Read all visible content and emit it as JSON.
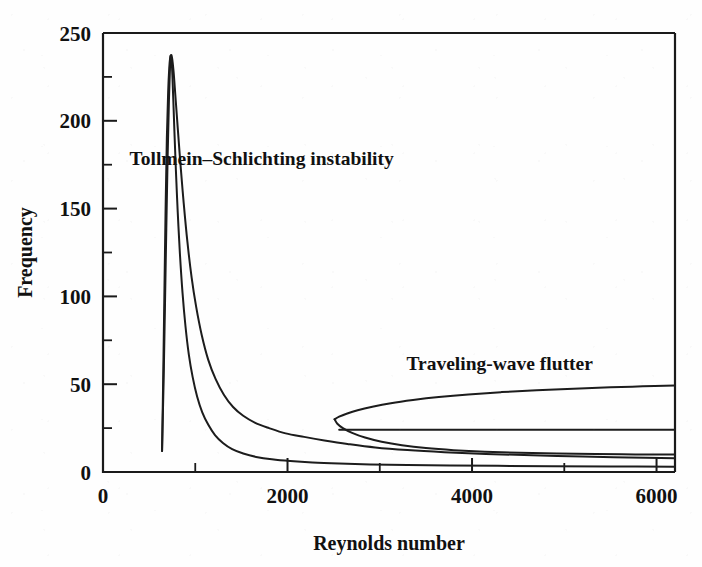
{
  "chart_data": {
    "type": "line",
    "title": "",
    "xlabel": "Reynolds number",
    "ylabel": "Frequency",
    "xlim": [
      0,
      6200
    ],
    "ylim": [
      0,
      250
    ],
    "grid": false,
    "legend": "none",
    "x_ticks_major": [
      0,
      2000,
      4000,
      6000
    ],
    "x_tick_labels": [
      "0",
      "2000",
      "4000",
      "6000"
    ],
    "x_ticks_minor": [
      1000,
      3000,
      5000
    ],
    "y_ticks_major": [
      0,
      50,
      100,
      150,
      200,
      250
    ],
    "y_tick_labels": [
      "0",
      "50",
      "100",
      "150",
      "200",
      "250"
    ],
    "y_ticks_minor": [
      25,
      75,
      125,
      175,
      225
    ],
    "annotations": [
      {
        "name": "tollmein-schlichting-label",
        "text": "Tollmein–Schlichting instability",
        "x": 1720,
        "y": 175
      },
      {
        "name": "traveling-wave-flutter-label",
        "text": "Traveling-wave flutter",
        "x": 4300,
        "y": 58
      }
    ],
    "series": [
      {
        "name": "Tollmein-Schlichting instability neutral curve (upper branch)",
        "points": [
          [
            640,
            12
          ],
          [
            660,
            60
          ],
          [
            680,
            120
          ],
          [
            700,
            178
          ],
          [
            715,
            212
          ],
          [
            726,
            230
          ],
          [
            735,
            237
          ],
          [
            748,
            236
          ],
          [
            765,
            228
          ],
          [
            785,
            214
          ],
          [
            810,
            196
          ],
          [
            840,
            175
          ],
          [
            875,
            153
          ],
          [
            915,
            131
          ],
          [
            960,
            111
          ],
          [
            1010,
            94
          ],
          [
            1070,
            78
          ],
          [
            1140,
            64
          ],
          [
            1220,
            53
          ],
          [
            1310,
            44
          ],
          [
            1410,
            37
          ],
          [
            1520,
            32
          ],
          [
            1650,
            28
          ],
          [
            1800,
            25
          ],
          [
            1980,
            22
          ],
          [
            2180,
            20
          ],
          [
            2400,
            18
          ],
          [
            2650,
            16
          ],
          [
            2950,
            14
          ],
          [
            3300,
            12.5
          ],
          [
            3700,
            11.3
          ],
          [
            4150,
            10.3
          ],
          [
            4650,
            9.5
          ],
          [
            5200,
            8.8
          ],
          [
            5700,
            8.3
          ],
          [
            6200,
            7.9
          ]
        ]
      },
      {
        "name": "Tollmein-Schlichting instability neutral curve (lower branch)",
        "points": [
          [
            640,
            12
          ],
          [
            652,
            52
          ],
          [
            665,
            100
          ],
          [
            678,
            148
          ],
          [
            692,
            190
          ],
          [
            706,
            216
          ],
          [
            718,
            230
          ],
          [
            728,
            236
          ],
          [
            736,
            237
          ],
          [
            744,
            234
          ],
          [
            752,
            226
          ],
          [
            762,
            212
          ],
          [
            774,
            194
          ],
          [
            790,
            172
          ],
          [
            810,
            148
          ],
          [
            834,
            124
          ],
          [
            862,
            102
          ],
          [
            894,
            83
          ],
          [
            930,
            67
          ],
          [
            972,
            54
          ],
          [
            1020,
            43
          ],
          [
            1076,
            34
          ],
          [
            1140,
            27
          ],
          [
            1214,
            21
          ],
          [
            1300,
            16.5
          ],
          [
            1400,
            13
          ],
          [
            1520,
            10.5
          ],
          [
            1660,
            8.6
          ],
          [
            1830,
            7.2
          ],
          [
            2030,
            6.2
          ],
          [
            2270,
            5.4
          ],
          [
            2560,
            4.8
          ],
          [
            2900,
            4.3
          ],
          [
            3300,
            4.0
          ],
          [
            3760,
            3.7
          ],
          [
            4280,
            3.5
          ],
          [
            4860,
            3.3
          ],
          [
            5500,
            3.2
          ],
          [
            6200,
            3.0
          ]
        ]
      },
      {
        "name": "Traveling-wave flutter boundary (upper branch)",
        "points": [
          [
            2510,
            30
          ],
          [
            2560,
            31.5
          ],
          [
            2640,
            33.2
          ],
          [
            2760,
            35.2
          ],
          [
            2920,
            37.2
          ],
          [
            3120,
            39.2
          ],
          [
            3360,
            41.0
          ],
          [
            3640,
            42.7
          ],
          [
            3960,
            44.2
          ],
          [
            4320,
            45.5
          ],
          [
            4700,
            46.5
          ],
          [
            5100,
            47.4
          ],
          [
            5500,
            48.2
          ],
          [
            5850,
            48.8
          ],
          [
            6200,
            49.3
          ]
        ]
      },
      {
        "name": "Traveling-wave flutter boundary (lower branch)",
        "points": [
          [
            2510,
            30
          ],
          [
            2540,
            27.5
          ],
          [
            2600,
            25.0
          ],
          [
            2700,
            22.3
          ],
          [
            2840,
            19.6
          ],
          [
            3020,
            17.2
          ],
          [
            3240,
            15.2
          ],
          [
            3500,
            13.6
          ],
          [
            3800,
            12.4
          ],
          [
            4140,
            11.5
          ],
          [
            4520,
            10.9
          ],
          [
            4920,
            10.5
          ],
          [
            5340,
            10.2
          ],
          [
            5770,
            10.0
          ],
          [
            6200,
            9.9
          ]
        ]
      },
      {
        "name": "Traveling-wave flutter plateau",
        "points": [
          [
            2560,
            24.0
          ],
          [
            2900,
            24.0
          ],
          [
            3400,
            24.0
          ],
          [
            4000,
            24.0
          ],
          [
            4600,
            24.0
          ],
          [
            5200,
            24.0
          ],
          [
            5700,
            24.0
          ],
          [
            6200,
            24.0
          ]
        ]
      }
    ]
  }
}
